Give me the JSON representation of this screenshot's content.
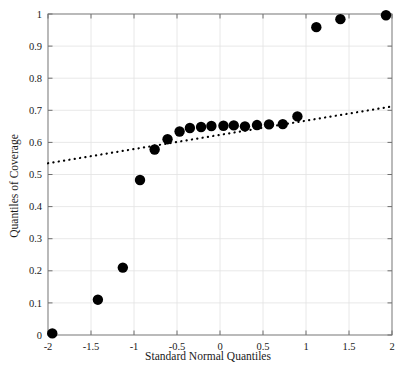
{
  "chart_data": {
    "type": "scatter",
    "title": "",
    "xlabel": "Standard Normal Quantiles",
    "ylabel": "Quantiles of Coverage",
    "xlim": [
      -2,
      2
    ],
    "ylim": [
      0,
      1
    ],
    "grid": true,
    "legend": null,
    "xticks": [
      -2,
      -1.5,
      -1,
      -0.5,
      0,
      0.5,
      1,
      1.5,
      2
    ],
    "xticklabels": [
      "-2",
      "-1.5",
      "-1",
      "-0.5",
      "0",
      "0.5",
      "1",
      "1.5",
      "2"
    ],
    "yticks": [
      0,
      0.1,
      0.2,
      0.3,
      0.4,
      0.5,
      0.6,
      0.7,
      0.8,
      0.9,
      1
    ],
    "yticklabels": [
      "0",
      "0.1",
      "0.2",
      "0.3",
      "0.4",
      "0.5",
      "0.6",
      "0.7",
      "0.8",
      "0.9",
      "1"
    ],
    "marker": "filled-circle",
    "marker_color": "#000000",
    "marker_size": 5.2,
    "series": [
      {
        "name": "Sample quantiles",
        "points": [
          [
            -1.95,
            0.005
          ],
          [
            -1.42,
            0.11
          ],
          [
            -1.13,
            0.21
          ],
          [
            -0.93,
            0.483
          ],
          [
            -0.76,
            0.578
          ],
          [
            -0.61,
            0.61
          ],
          [
            -0.47,
            0.634
          ],
          [
            -0.35,
            0.645
          ],
          [
            -0.22,
            0.648
          ],
          [
            -0.1,
            0.651
          ],
          [
            0.04,
            0.652
          ],
          [
            0.16,
            0.653
          ],
          [
            0.29,
            0.65
          ],
          [
            0.43,
            0.654
          ],
          [
            0.57,
            0.656
          ],
          [
            0.73,
            0.657
          ],
          [
            0.9,
            0.681
          ],
          [
            1.12,
            0.959
          ],
          [
            1.4,
            0.984
          ],
          [
            1.93,
            0.996
          ]
        ]
      }
    ],
    "reference_line": {
      "name": "robust fit line",
      "style": "dotted",
      "color": "#000000",
      "x": [
        -2,
        2
      ],
      "y": [
        0.535,
        0.712
      ]
    }
  },
  "axes": {
    "x_title": "Standard Normal Quantiles",
    "y_title": "Quantiles of Coverage"
  }
}
